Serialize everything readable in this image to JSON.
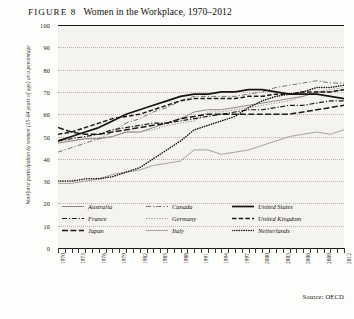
{
  "figure": {
    "number_label": "FIGURE 8",
    "title": "Women in the Workplace, 1970–2012",
    "source": "Source: OECD"
  },
  "axes": {
    "ylabel": "Workforce participation by women (15–64 years of age) as a percentage",
    "yticks": [
      "100",
      "90",
      "80",
      "70",
      "60",
      "50",
      "40",
      "30",
      "20",
      "10",
      "0"
    ],
    "xlabels": [
      "1970",
      "1973",
      "1976",
      "1979",
      "1982",
      "1985",
      "1988",
      "1991",
      "1994",
      "1997",
      "2000",
      "2003",
      "2006",
      "2009",
      "2012"
    ]
  },
  "legend": {
    "entries": [
      {
        "label": "Australia",
        "style": "solid-gray",
        "color": "#8d8a84"
      },
      {
        "label": "Canada",
        "style": "dash-dot-gray",
        "color": "#6f6c67"
      },
      {
        "label": "United States",
        "style": "solid-black",
        "color": "#17150f"
      },
      {
        "label": "France",
        "style": "dash-dot-black",
        "color": "#1d1b15"
      },
      {
        "label": "Germany",
        "style": "dotted-gray",
        "color": "#8a8781"
      },
      {
        "label": "United Kingdom",
        "style": "dashed-black",
        "color": "#1d1b15"
      },
      {
        "label": "Japan",
        "style": "dash-black",
        "color": "#1d1b15"
      },
      {
        "label": "Italy",
        "style": "solid-light",
        "color": "#a5a29c"
      },
      {
        "label": "Netherlands",
        "style": "dotted-black",
        "color": "#17150f"
      }
    ]
  },
  "chart_data": {
    "type": "line",
    "title": "Women in the Workplace, 1970–2012",
    "xlabel": "",
    "ylabel": "Workforce participation by women (15–64 years of age) as a percentage",
    "xlim": [
      1970,
      2012
    ],
    "ylim": [
      0,
      100
    ],
    "grid": true,
    "legend_position": "inside-bottom",
    "x": [
      1970,
      1972,
      1974,
      1976,
      1978,
      1980,
      1982,
      1984,
      1986,
      1988,
      1990,
      1992,
      1994,
      1996,
      1998,
      2000,
      2002,
      2004,
      2006,
      2008,
      2010,
      2012
    ],
    "series": [
      {
        "name": "Australia",
        "color": "#8d8a84",
        "values": [
          47,
          48,
          49,
          49,
          50,
          52,
          52,
          54,
          56,
          58,
          61,
          62,
          62,
          63,
          64,
          65,
          66,
          67,
          68,
          70,
          70,
          71
        ]
      },
      {
        "name": "Canada",
        "color": "#6f6c67",
        "values": [
          43,
          45,
          47,
          49,
          52,
          56,
          58,
          61,
          63,
          66,
          68,
          68,
          68,
          68,
          69,
          70,
          72,
          73,
          74,
          75,
          74,
          74
        ]
      },
      {
        "name": "United States",
        "color": "#17150f",
        "values": [
          48,
          50,
          52,
          54,
          57,
          60,
          62,
          64,
          66,
          68,
          69,
          69,
          70,
          70,
          71,
          71,
          70,
          69,
          69,
          69,
          68,
          67
        ]
      },
      {
        "name": "France",
        "color": "#1d1b15",
        "values": [
          48,
          49,
          50,
          51,
          53,
          54,
          55,
          56,
          56,
          57,
          58,
          59,
          60,
          61,
          62,
          62,
          63,
          64,
          64,
          65,
          66,
          66
        ]
      },
      {
        "name": "Germany",
        "color": "#8a8781",
        "values": [
          48,
          48,
          49,
          49,
          50,
          52,
          52,
          53,
          55,
          56,
          57,
          61,
          61,
          62,
          63,
          64,
          65,
          66,
          68,
          70,
          71,
          72
        ]
      },
      {
        "name": "United Kingdom",
        "color": "#1d1b15",
        "values": [
          51,
          52,
          54,
          56,
          58,
          59,
          60,
          62,
          64,
          66,
          67,
          67,
          67,
          67,
          68,
          68,
          69,
          69,
          70,
          70,
          70,
          71
        ]
      },
      {
        "name": "Japan",
        "color": "#1d1b15",
        "values": [
          54,
          52,
          51,
          51,
          52,
          53,
          54,
          55,
          56,
          58,
          59,
          60,
          60,
          60,
          60,
          60,
          60,
          60,
          61,
          62,
          63,
          64
        ]
      },
      {
        "name": "Italy",
        "color": "#a5a29c",
        "values": [
          29,
          29,
          30,
          31,
          33,
          34,
          35,
          37,
          38,
          39,
          44,
          44,
          42,
          43,
          44,
          46,
          48,
          50,
          51,
          52,
          51,
          53
        ]
      },
      {
        "name": "Netherlands",
        "color": "#17150f",
        "values": [
          30,
          30,
          31,
          31,
          32,
          34,
          36,
          40,
          44,
          48,
          53,
          55,
          57,
          59,
          63,
          66,
          68,
          69,
          70,
          72,
          72,
          73
        ]
      }
    ]
  }
}
